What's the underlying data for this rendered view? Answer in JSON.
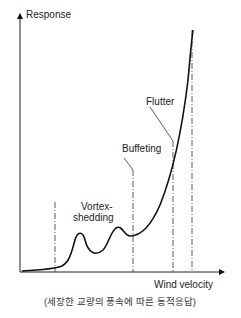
{
  "diagram": {
    "y_axis_label": "Response",
    "x_axis_label": "Wind velocity",
    "labels": {
      "vortex_line1": "Vortex-",
      "vortex_line2": "shedding",
      "buffeting": "Buffeting",
      "flutter": "Flutter"
    },
    "caption": "(세장한 교량의 풍속에 따른 동적응답)",
    "colors": {
      "line": "#111111",
      "text": "#222222"
    }
  }
}
